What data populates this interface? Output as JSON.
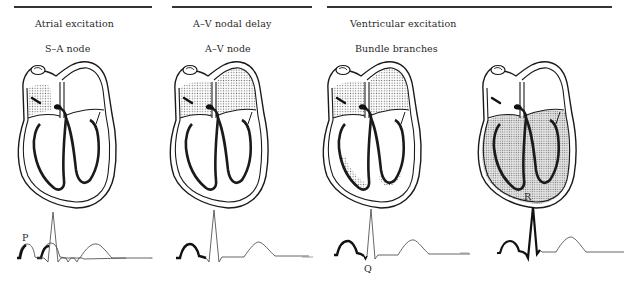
{
  "phases": [
    {
      "title": "Atrial excitation",
      "rule": [
        14,
        152
      ]
    },
    {
      "title": "A–V nodal delay",
      "rule": [
        172,
        312
      ]
    },
    {
      "title": "Ventricular excitation",
      "rule": [
        327,
        612
      ]
    }
  ],
  "panels": [
    {
      "id": "panel-1",
      "structure_label": "S–A node",
      "shaded_region": "right atrium near S-A node",
      "ecg_highlight": "P wave start",
      "ecg_label": "P"
    },
    {
      "id": "panel-2",
      "structure_label": "A–V node",
      "shaded_region": "both atria",
      "ecg_highlight": "P wave + PR segment",
      "ecg_label": ""
    },
    {
      "id": "panel-3",
      "structure_label": "Bundle branches",
      "shaded_region": "atria + septum edges",
      "ecg_highlight": "P wave + PR segment + Q wave",
      "ecg_label": "Q"
    },
    {
      "id": "panel-4",
      "structure_label": "",
      "shaded_region": "ventricles",
      "ecg_highlight": "P wave through R wave",
      "ecg_label": "R"
    }
  ],
  "colors": {
    "ink": "#1a1a1a",
    "trace": "#555555",
    "stipple": "#8a8a8a",
    "rule": "#333333"
  }
}
